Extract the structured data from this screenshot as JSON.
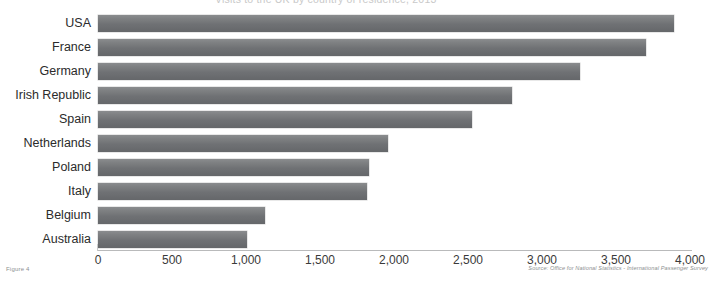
{
  "figure": {
    "caption": "Figure 4",
    "source_note": "Source: Office for National Statistics - International Passenger Survey",
    "clipped_title": "Visits to the UK by country of residence, 2013"
  },
  "chart_data": {
    "type": "bar",
    "orientation": "horizontal",
    "title": "",
    "xlabel": "",
    "ylabel": "",
    "categories": [
      "USA",
      "France",
      "Germany",
      "Irish Republic",
      "Spain",
      "Netherlands",
      "Poland",
      "Italy",
      "Belgium",
      "Australia"
    ],
    "values": [
      3890,
      3700,
      3260,
      2800,
      2530,
      1960,
      1830,
      1820,
      1130,
      1010
    ],
    "xlim": [
      0,
      4000
    ],
    "xticks": [
      0,
      500,
      1000,
      1500,
      2000,
      2500,
      3000,
      3500,
      4000
    ],
    "xticklabels": [
      "0",
      "500",
      "1,000",
      "1,500",
      "2,000",
      "2,500",
      "3,000",
      "3,500",
      "4,000"
    ],
    "grid": false,
    "legend": false,
    "bar_color": "#6f7174"
  }
}
